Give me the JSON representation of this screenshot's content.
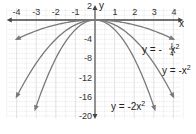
{
  "chart_data": {
    "type": "line",
    "title": "",
    "xlabel": "x",
    "ylabel": "y",
    "xlim": [
      -4,
      4
    ],
    "ylim": [
      -20,
      2
    ],
    "grid": true,
    "x_ticks": [
      -4,
      -3,
      -2,
      -1,
      1,
      2,
      3,
      4
    ],
    "x_tick_labels": [
      "-4",
      "-3",
      "-2",
      "-1",
      "1",
      "2",
      "3",
      "4"
    ],
    "y_ticks": [
      2,
      -4,
      -8,
      -12,
      -16,
      -20
    ],
    "y_tick_labels": [
      "2",
      "-4",
      "-8",
      "-12",
      "-16",
      "-20"
    ],
    "series": [
      {
        "name": "y = -1/4 x^2",
        "label_main": "y = -",
        "label_num": "1",
        "label_den": "4",
        "label_var": "x",
        "label_exp": "2",
        "coef": -0.25,
        "x_range": [
          -4,
          4
        ],
        "x": [
          -4,
          -3,
          -2,
          -1,
          0,
          1,
          2,
          3,
          4
        ],
        "y": [
          -4,
          -2.25,
          -1,
          -0.25,
          0,
          -0.25,
          -1,
          -2.25,
          -4
        ]
      },
      {
        "name": "y = -x^2",
        "label_main": "y = -x",
        "label_exp": "2",
        "coef": -1,
        "x_range": [
          -4,
          4
        ],
        "x": [
          -4,
          -3,
          -2,
          -1,
          0,
          1,
          2,
          3,
          4
        ],
        "y": [
          -16,
          -9,
          -4,
          -1,
          0,
          -1,
          -4,
          -9,
          -16
        ]
      },
      {
        "name": "y = -2x^2",
        "label_main": "y = -2x",
        "label_exp": "2",
        "coef": -2,
        "x_range": [
          -3.1,
          3.1
        ],
        "x": [
          -3,
          -2,
          -1,
          0,
          1,
          2,
          3
        ],
        "y": [
          -18,
          -8,
          -2,
          0,
          -2,
          -8,
          -18
        ]
      }
    ]
  },
  "axes": {
    "x_name": "x",
    "y_name": "y"
  },
  "colors": {
    "curve": "#7a7a7a",
    "axis": "#444444",
    "grid": "#d9d9d9",
    "text": "#222222"
  }
}
